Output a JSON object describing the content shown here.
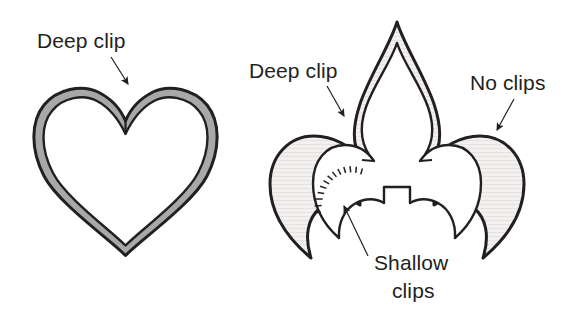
{
  "figure": {
    "background_color": "#ffffff",
    "ink_color": "#231f20",
    "heart_band_color": "#a8a8a8",
    "fleur_band_color": "#f1f0ee",
    "band_hatch_color": "#b9b7b4"
  },
  "annotations": [
    {
      "id": "heart-deep-clip",
      "label": "Deep clip",
      "text_x": 37,
      "text_y": 48,
      "leader_x1": 111,
      "leader_y1": 57,
      "leader_x2": 128,
      "leader_y2": 82,
      "arrow_x": 133,
      "arrow_y": 92,
      "arrow_angle": 58
    },
    {
      "id": "fleur-deep-clip",
      "label": "Deep clip",
      "text_x": 249,
      "text_y": 78,
      "leader_x1": 327,
      "leader_y1": 86,
      "leader_x2": 342,
      "leader_y2": 113,
      "arrow_x": 347,
      "arrow_y": 123,
      "arrow_angle": 60
    },
    {
      "id": "fleur-no-clips",
      "label": "No clips",
      "text_x": 470,
      "text_y": 90,
      "leader_x1": 512,
      "leader_y1": 100,
      "leader_x2": 498,
      "leader_y2": 128,
      "arrow_x": 493,
      "arrow_y": 138,
      "arrow_angle": 116
    },
    {
      "id": "fleur-shallow-clips",
      "label_line1": "Shallow",
      "label_line2": "clips",
      "text_x": 374,
      "text_y": 270,
      "text_y2": 298,
      "leader_x1": 366,
      "leader_y1": 254,
      "leader_x2": 342,
      "leader_y2": 213,
      "arrow_x": 336,
      "arrow_y": 203,
      "arrow_angle": 239
    }
  ],
  "shapes": {
    "heart": {
      "name": "heart-outline",
      "outer_path": "M 125.5 255.5 C 108 238 58 203 44 176 C 30 149 31 121 44 105 C 57 89 82 84 98 92 C 112 99 121 110 125.5 121 C 130 110 139 99 153 92 C 169 84 194 89 207 105 C 220 121 221 149 207 176 C 193 203 143 238 125.5 255.5 Z",
      "inner_path": "M 125.5 245.5 C 109 229 66 198 53 173 C 40 148 41 124 52 111 C 63 97 84 94 97 101 C 110 108 119 120 125.5 134 C 132 120 141 108 154 101 C 167 94 188 97 199 111 C 210 124 211 148 198 173 C 185 198 142 229 125.5 245.5 Z",
      "notch_label": "deep clip notch at top center"
    },
    "fleur": {
      "name": "fleur-de-lis-outline",
      "outer_path": "M 397 22 C 404 45 425 77 434 104 C 443 131 441 148 432 160 L 432 160 C 443 146 461 136 480 136 C 505 136 524 156 524 184 C 524 212 508 237 483 258 C 490 236 486 218 474 208 C 462 198 446 197 434 205 L 434 178 L 360 178 L 360 205 C 348 197 332 198 320 208 C 308 218 304 236 311 258 C 286 237 270 212 270 184 C 270 156 289 136 314 136 C 333 136 351 146 362 160 C 353 148 351 131 360 104 C 369 77 390 45 397 22 Z",
      "inner_path": "M 397 43 C 403 62 420 84 428 107 C 436 130 432 148 420 161 L 420 161 C 426 152 436 145 449 145 C 468 145 481 161 481 183 C 481 205 471 224 455 238 C 456 222 449 209 438 203 C 429 198 418 198 410 203 L 410 187 L 384 187 L 384 203 C 376 198 365 198 356 203 C 345 209 338 222 339 238 C 323 224 313 205 313 183 C 313 161 326 145 345 145 C 358 145 368 152 374 161 C 362 148 358 130 366 107 C 374 84 391 62 397 43 Z",
      "shallow_clip_region": "left lower lobe inner curve"
    }
  },
  "shallow_clips": {
    "count": 13,
    "tick_length": 7,
    "description": "small radial notches cut into the inner edge of the lower left lobe band"
  }
}
